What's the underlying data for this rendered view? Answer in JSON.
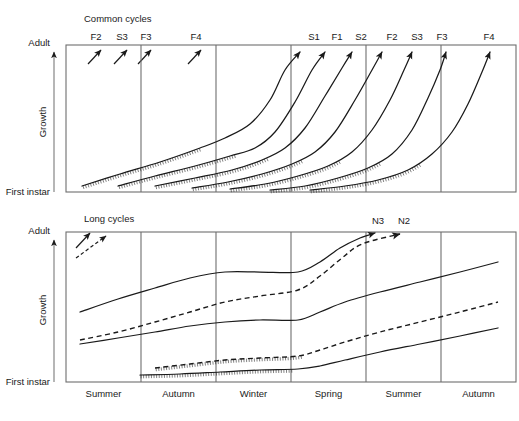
{
  "figure": {
    "background": "#ffffff",
    "line_color": "#1a1a1a",
    "axis_color": "#6e6e6e"
  },
  "axes": {
    "y_top_label": "Adult",
    "y_title": "Growth",
    "y_bottom_label": "First instar",
    "seasons": [
      "Summer",
      "Autumn",
      "Winter",
      "Spring",
      "Summer",
      "Autumn"
    ]
  },
  "panels": {
    "top": {
      "title": "Common cycles",
      "cohorts": [
        "F2",
        "S3",
        "F3",
        "F4",
        "S1",
        "F1",
        "S2",
        "F2",
        "S3",
        "F3",
        "F4"
      ]
    },
    "bottom": {
      "title": "Long cycles",
      "cohorts": [
        "N3",
        "N2"
      ]
    }
  },
  "chart_data": {
    "type": "line",
    "xlabel": "",
    "ylabel": "Growth",
    "ylim_labels": [
      "First instar",
      "Adult"
    ],
    "categories": [
      "Summer",
      "Autumn",
      "Winter",
      "Spring",
      "Summer",
      "Autumn"
    ],
    "grid": true,
    "legend": "none",
    "panels": [
      {
        "name": "Common cycles",
        "annotation": "Common cycles",
        "legend_arrows": [
          {
            "label": "F2",
            "style": "solid",
            "x": 94,
            "y": 38
          },
          {
            "label": "S3",
            "style": "solid",
            "x": 121,
            "y": 38
          },
          {
            "label": "F3",
            "style": "solid",
            "x": 145,
            "y": 38
          },
          {
            "label": "F4",
            "style": "solid",
            "x": 194,
            "y": 38
          }
        ],
        "series": [
          {
            "name": "S1",
            "style": "solid",
            "diapause": true,
            "label_x": 315,
            "points": [
              [
                82,
                186
              ],
              [
                120,
                174
              ],
              [
                160,
                162
              ],
              [
                200,
                148
              ],
              [
                225,
                138
              ],
              [
                250,
                124
              ],
              [
                270,
                100
              ],
              [
                285,
                70
              ],
              [
                300,
                52
              ]
            ]
          },
          {
            "name": "F1",
            "style": "solid",
            "diapause": true,
            "label_x": 337,
            "points": [
              [
                118,
                186
              ],
              [
                155,
                176
              ],
              [
                195,
                166
              ],
              [
                230,
                156
              ],
              [
                255,
                148
              ],
              [
                275,
                132
              ],
              [
                295,
                102
              ],
              [
                312,
                70
              ],
              [
                325,
                52
              ]
            ]
          },
          {
            "name": "S2",
            "style": "solid",
            "diapause": true,
            "label_x": 360,
            "points": [
              [
                155,
                186
              ],
              [
                195,
                178
              ],
              [
                232,
                170
              ],
              [
                262,
                160
              ],
              [
                285,
                148
              ],
              [
                305,
                128
              ],
              [
                325,
                96
              ],
              [
                342,
                68
              ],
              [
                352,
                52
              ]
            ]
          },
          {
            "name": "F2",
            "style": "solid",
            "diapause": true,
            "label_x": 390,
            "points": [
              [
                192,
                188
              ],
              [
                228,
                182
              ],
              [
                262,
                174
              ],
              [
                292,
                164
              ],
              [
                315,
                152
              ],
              [
                335,
                132
              ],
              [
                355,
                100
              ],
              [
                372,
                70
              ],
              [
                382,
                52
              ]
            ]
          },
          {
            "name": "S3",
            "style": "solid",
            "diapause": true,
            "label_x": 415,
            "points": [
              [
                230,
                189
              ],
              [
                265,
                184
              ],
              [
                298,
                176
              ],
              [
                328,
                166
              ],
              [
                352,
                152
              ],
              [
                372,
                130
              ],
              [
                390,
                100
              ],
              [
                404,
                70
              ],
              [
                412,
                52
              ]
            ]
          },
          {
            "name": "F3",
            "style": "solid",
            "diapause": true,
            "label_x": 440,
            "points": [
              [
                270,
                190
              ],
              [
                305,
                186
              ],
              [
                338,
                178
              ],
              [
                368,
                168
              ],
              [
                392,
                154
              ],
              [
                412,
                130
              ],
              [
                428,
                98
              ],
              [
                440,
                70
              ],
              [
                446,
                52
              ]
            ]
          },
          {
            "name": "F4",
            "style": "solid",
            "diapause": true,
            "label_x": 487,
            "points": [
              [
                310,
                190
              ],
              [
                345,
                186
              ],
              [
                378,
                180
              ],
              [
                408,
                170
              ],
              [
                432,
                154
              ],
              [
                452,
                132
              ],
              [
                468,
                104
              ],
              [
                482,
                72
              ],
              [
                490,
                52
              ]
            ]
          }
        ]
      },
      {
        "name": "Long cycles",
        "annotation": "Long cycles",
        "legend_arrows": [
          {
            "label": "",
            "style": "solid",
            "x": 86,
            "y": 232
          },
          {
            "label": "",
            "style": "dashed",
            "x": 108,
            "y": 232
          }
        ],
        "series": [
          {
            "name": "N3",
            "style": "solid",
            "diapause": false,
            "label_x": 378,
            "points": [
              [
                80,
                312
              ],
              [
                118,
                299
              ],
              [
                155,
                288
              ],
              [
                190,
                278
              ],
              [
                225,
                272
              ],
              [
                260,
                272
              ],
              [
                298,
                272
              ],
              [
                320,
                262
              ],
              [
                340,
                248
              ],
              [
                360,
                238
              ],
              [
                375,
                233
              ]
            ]
          },
          {
            "name": "N2",
            "style": "dashed",
            "diapause": false,
            "label_x": 404,
            "points": [
              [
                80,
                340
              ],
              [
                118,
                332
              ],
              [
                155,
                322
              ],
              [
                190,
                312
              ],
              [
                225,
                302
              ],
              [
                260,
                296
              ],
              [
                298,
                290
              ],
              [
                320,
                276
              ],
              [
                342,
                258
              ],
              [
                362,
                244
              ],
              [
                400,
                234
              ]
            ]
          },
          {
            "name": "track-3",
            "style": "solid",
            "diapause": false,
            "label_x": null,
            "points": [
              [
                80,
                344
              ],
              [
                118,
                338
              ],
              [
                155,
                332
              ],
              [
                190,
                326
              ],
              [
                225,
                322
              ],
              [
                260,
                320
              ],
              [
                298,
                320
              ],
              [
                320,
                312
              ],
              [
                345,
                302
              ],
              [
                380,
                292
              ],
              [
                420,
                282
              ],
              [
                460,
                272
              ],
              [
                498,
                262
              ]
            ]
          },
          {
            "name": "track-4",
            "style": "dashed",
            "diapause": true,
            "label_x": null,
            "points": [
              [
                155,
                368
              ],
              [
                190,
                364
              ],
              [
                225,
                360
              ],
              [
                260,
                358
              ],
              [
                298,
                356
              ],
              [
                320,
                350
              ],
              [
                345,
                342
              ],
              [
                380,
                332
              ],
              [
                420,
                322
              ],
              [
                460,
                312
              ],
              [
                498,
                302
              ]
            ]
          },
          {
            "name": "track-5",
            "style": "solid",
            "diapause": true,
            "label_x": null,
            "points": [
              [
                140,
                375
              ],
              [
                180,
                374
              ],
              [
                220,
                372
              ],
              [
                260,
                370
              ],
              [
                298,
                369
              ],
              [
                320,
                366
              ],
              [
                345,
                360
              ],
              [
                380,
                352
              ],
              [
                420,
                344
              ],
              [
                460,
                336
              ],
              [
                498,
                328
              ]
            ]
          }
        ]
      }
    ]
  }
}
